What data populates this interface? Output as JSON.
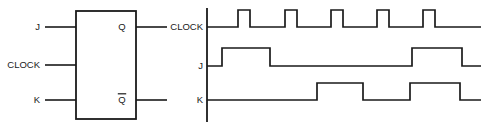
{
  "figure": {
    "type": "jk-flip-flop-timing-diagram",
    "line_color": "#1a1a1a",
    "background": "#ffffff"
  },
  "flipflop": {
    "name": "JK flip-flop",
    "box": {
      "x": 76,
      "y": 11,
      "width": 60,
      "height": 108
    },
    "inputs": [
      {
        "id": "j",
        "label": "J",
        "y": 27,
        "stub_x1": 45,
        "stub_x2": 76
      },
      {
        "id": "clock",
        "label": "CLOCK",
        "y": 65,
        "stub_x1": 45,
        "stub_x2": 76
      },
      {
        "id": "k",
        "label": "K",
        "y": 100,
        "stub_x1": 45,
        "stub_x2": 76
      }
    ],
    "outputs": [
      {
        "id": "q",
        "label": "Q",
        "overbar": false,
        "y": 27,
        "stub_x1": 136,
        "stub_x2": 167
      },
      {
        "id": "qbar",
        "label": "Q",
        "overbar": true,
        "y": 100,
        "stub_x1": 136,
        "stub_x2": 167
      }
    ]
  },
  "timing": {
    "axis": {
      "x": 207,
      "y_top": 8,
      "y_bottom": 122
    },
    "trace_start_x": 207,
    "trace_end_x": 481,
    "labels": {
      "clock": "CLOCK",
      "j": "J",
      "k": "K"
    },
    "label_x": 203,
    "rows": [
      {
        "id": "clock",
        "label": "CLOCK",
        "label_y": 30,
        "baseline_y": 27,
        "high_y": 10,
        "pulses": [
          {
            "rise": 238,
            "fall": 250
          },
          {
            "rise": 285,
            "fall": 297
          },
          {
            "rise": 331,
            "fall": 343
          },
          {
            "rise": 377,
            "fall": 389
          },
          {
            "rise": 423,
            "fall": 435
          }
        ]
      },
      {
        "id": "j",
        "label": "J",
        "label_y": 69,
        "baseline_y": 66,
        "high_y": 48,
        "pulses": [
          {
            "rise": 222,
            "fall": 270
          },
          {
            "rise": 412,
            "fall": 462
          }
        ]
      },
      {
        "id": "k",
        "label": "K",
        "label_y": 103,
        "baseline_y": 100,
        "high_y": 83,
        "pulses": [
          {
            "rise": 317,
            "fall": 363
          },
          {
            "rise": 410,
            "fall": 460
          }
        ]
      }
    ]
  },
  "chart_data": {
    "type": "line",
    "xlabel": "time",
    "ylabel": "logic level",
    "grid": false,
    "legend": "none",
    "signal_levels": {
      "low": 0,
      "high": 1
    },
    "series": [
      {
        "name": "CLOCK",
        "description": "Five equal-width clock pulses, low between pulses",
        "transitions_px": [
          238,
          250,
          285,
          297,
          331,
          343,
          377,
          389,
          423,
          435
        ],
        "values": [
          0,
          1,
          0,
          1,
          0,
          1,
          0,
          1,
          0,
          1,
          0
        ]
      },
      {
        "name": "J",
        "description": "Two high intervals",
        "transitions_px": [
          222,
          270,
          412,
          462
        ],
        "values": [
          0,
          1,
          0,
          1,
          0
        ]
      },
      {
        "name": "K",
        "description": "Two high intervals, later than J's first",
        "transitions_px": [
          317,
          363,
          410,
          460
        ],
        "values": [
          0,
          1,
          0,
          1,
          0
        ]
      }
    ]
  }
}
